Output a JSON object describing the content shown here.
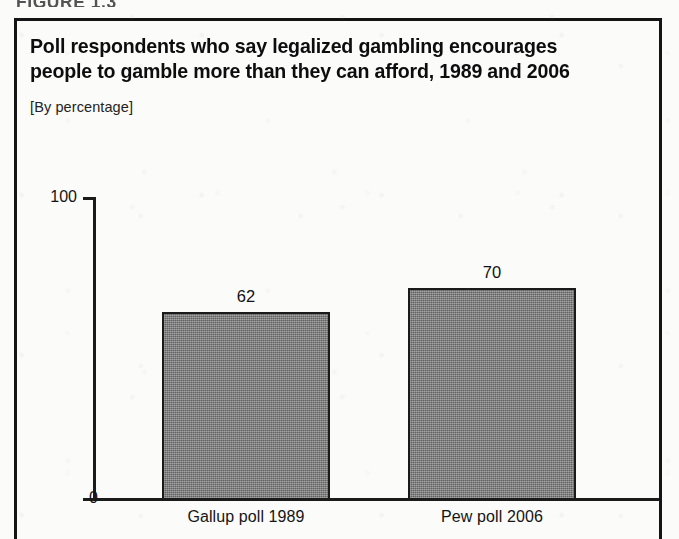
{
  "figure_header": "FIGURE 1.3",
  "title_line_1": "Poll respondents who say legalized gambling encourages",
  "title_line_2": "people to gamble more than they can afford, 1989 and 2006",
  "subtitle": "[By percentage]",
  "colors": {
    "bar_fill": "#7d7d7d",
    "bar_border": "#1a1a1a",
    "frame": "#141414",
    "text": "#0d0d0d",
    "paper": "#fbfbf9"
  },
  "chart_data": {
    "type": "bar",
    "title": "Poll respondents who say legalized gambling encourages people to gamble more than they can afford, 1989 and 2006",
    "subtitle": "[By percentage]",
    "categories": [
      "Gallup poll 1989",
      "Pew poll 2006"
    ],
    "values": [
      62,
      70
    ],
    "value_labels": [
      "62",
      "70"
    ],
    "xlabel": "",
    "ylabel": "",
    "ylim": [
      0,
      100
    ],
    "ytick_labels": [
      "0",
      "100"
    ],
    "grid": false,
    "legend": null,
    "orientation": "vertical"
  }
}
